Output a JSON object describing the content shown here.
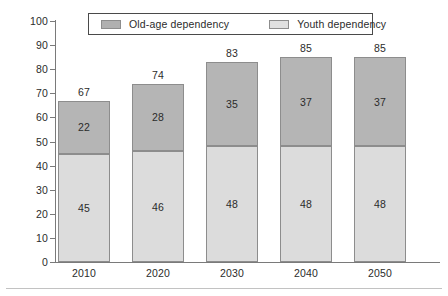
{
  "chart_data": {
    "type": "bar",
    "subtype": "stacked-vertical",
    "title": "",
    "subtitle": "",
    "xlabel": "",
    "ylabel": "",
    "categories": [
      "2010",
      "2020",
      "2030",
      "2040",
      "2050"
    ],
    "series": [
      {
        "name": "Youth dependency",
        "values": [
          45,
          46,
          48,
          48,
          48
        ],
        "color": "#dcdcdc",
        "stack_position": "bottom"
      },
      {
        "name": "Old-age dependency",
        "values": [
          22,
          28,
          35,
          37,
          37
        ],
        "color": "#b5b5b5",
        "stack_position": "top"
      }
    ],
    "totals": [
      67,
      74,
      83,
      85,
      85
    ],
    "ylim": [
      0,
      100
    ],
    "ytick_step": 10,
    "ytick_labels": [
      "100",
      "90",
      "80",
      "70",
      "60",
      "50",
      "40",
      "30",
      "20",
      "10",
      "0"
    ],
    "grid": false,
    "legend_position": "top-center",
    "legend_entries": [
      "Old-age dependency",
      "Youth dependency"
    ]
  },
  "legend": {
    "old_age_label": "Old-age dependency",
    "youth_label": "Youth dependency"
  },
  "colors": {
    "old_age": "#b5b5b5",
    "youth": "#dcdcdc",
    "axis": "#7a7a7a",
    "text": "#2b2b2b",
    "bar_border": "#8d8d8d"
  }
}
